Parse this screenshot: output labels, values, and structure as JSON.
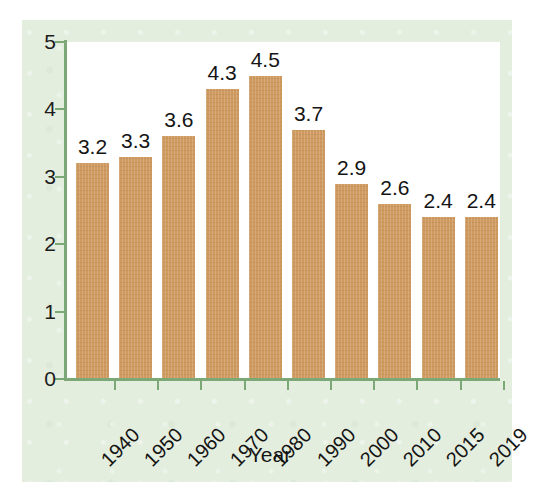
{
  "chart_data": {
    "type": "bar",
    "title": "",
    "xlabel": "Year",
    "ylabel": "",
    "categories": [
      "1940",
      "1950",
      "1960",
      "1970",
      "1980",
      "1990",
      "2000",
      "2010",
      "2015",
      "2019"
    ],
    "values": [
      3.2,
      3.3,
      3.6,
      4.3,
      4.5,
      3.7,
      2.9,
      2.6,
      2.4,
      2.4
    ],
    "value_labels": [
      "3.2",
      "3.3",
      "3.6",
      "4.3",
      "4.5",
      "3.7",
      "2.9",
      "2.6",
      "2.4",
      "2.4"
    ],
    "ylim": [
      0,
      5
    ],
    "ytick_labels": [
      "0",
      "1",
      "2",
      "3",
      "4",
      "5"
    ],
    "ytick_values": [
      0,
      1,
      2,
      3,
      4,
      5
    ],
    "grid": false,
    "legend": null,
    "bar_color": "#cf9a60",
    "axis_color": "#7ba876",
    "plot_background": "#ffffff",
    "panel_background": "#e4eedf",
    "text_color": "#141414",
    "xtick_rotation": -45
  }
}
